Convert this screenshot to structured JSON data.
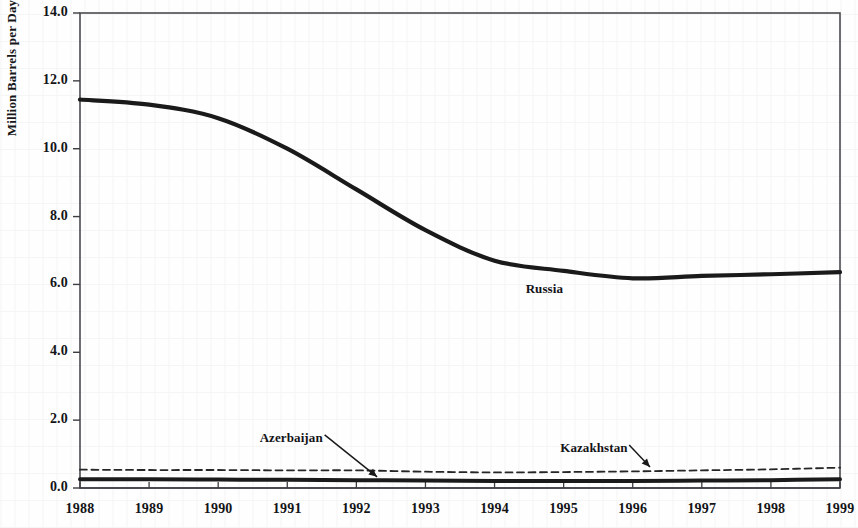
{
  "chart_data": {
    "type": "line",
    "title": "",
    "subtitle": "",
    "xlabel": "",
    "ylabel": "Million Barrels per Day",
    "xlim": [
      1988,
      1999
    ],
    "ylim": [
      0.0,
      14.0
    ],
    "ytick_step": 2.0,
    "grid": false,
    "legend_position": "inline-annotations",
    "x": [
      1988,
      1989,
      1990,
      1991,
      1992,
      1993,
      1994,
      1995,
      1996,
      1997,
      1998,
      1999
    ],
    "xtick_labels": [
      "1988",
      "1989",
      "1990",
      "1991",
      "1992",
      "1993",
      "1994",
      "1995",
      "1996",
      "1997",
      "1998",
      "1999"
    ],
    "ytick_labels": [
      "0.0",
      "2.0",
      "4.0",
      "6.0",
      "8.0",
      "10.0",
      "12.0",
      "14.0"
    ],
    "ytick_values": [
      0.0,
      2.0,
      4.0,
      6.0,
      8.0,
      10.0,
      12.0,
      14.0
    ],
    "series": [
      {
        "name": "Russia",
        "style": "solid",
        "color": "#1a1a1a",
        "width": 4.2,
        "values": [
          11.45,
          11.3,
          10.9,
          10.0,
          8.8,
          7.6,
          6.7,
          6.4,
          6.18,
          6.25,
          6.3,
          6.36
        ]
      },
      {
        "name": "Azerbaijan",
        "style": "solid",
        "color": "#1a1a1a",
        "width": 4.0,
        "values": [
          0.26,
          0.26,
          0.25,
          0.24,
          0.23,
          0.22,
          0.21,
          0.21,
          0.21,
          0.22,
          0.23,
          0.26
        ]
      },
      {
        "name": "Kazakhstan",
        "style": "dashed",
        "color": "#262626",
        "width": 1.8,
        "values": [
          0.54,
          0.53,
          0.53,
          0.52,
          0.52,
          0.48,
          0.46,
          0.47,
          0.49,
          0.52,
          0.55,
          0.6
        ]
      }
    ],
    "annotations": [
      {
        "text": "Russia",
        "x": 1994.45,
        "y": 5.85,
        "arrow": false
      },
      {
        "text": "Azerbaijan",
        "x": 1990.6,
        "y": 1.45,
        "arrow": true,
        "arrow_to_x": 1992.3,
        "arrow_to_y": 0.33
      },
      {
        "text": "Kazakhstan",
        "x": 1994.95,
        "y": 1.15,
        "arrow": true,
        "arrow_to_x": 1996.25,
        "arrow_to_y": 0.62
      }
    ]
  },
  "axis": {
    "y_title": "Million Barrels per Day"
  },
  "colors": {
    "ink": "#1a1a1a",
    "frame": "#4a4a50",
    "paper": "#fefefe"
  }
}
